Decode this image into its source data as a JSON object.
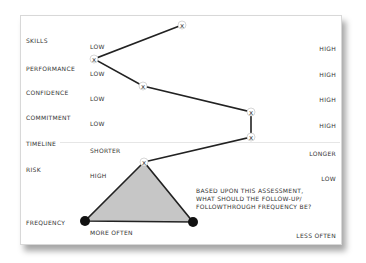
{
  "rows": [
    {
      "label": "SKILLS",
      "low": "LOW",
      "high": "HIGH"
    },
    {
      "label": "PERFORMANCE",
      "low": "LOW",
      "high": "HIGH"
    },
    {
      "label": "CONFIDENCE",
      "low": "LOW",
      "high": "HIGH"
    },
    {
      "label": "COMMITMENT",
      "low": "LOW",
      "high": "HIGH"
    },
    {
      "label": "TIMELINE",
      "low": "SHORTER",
      "high": "LONGER"
    },
    {
      "label": "RISK",
      "low": "HIGH",
      "high": "LOW"
    },
    {
      "label": "FREQUENCY",
      "low": "MORE OFTEN",
      "high": "LESS OFTEN"
    }
  ],
  "question": "BASED UPON THIS ASSESSMENT,\nWHAT SHOULD THE FOLLOW-UP/\nFOLLOWTHROUGH FREQUENCY BE?",
  "markers": [
    {
      "name": "skills",
      "x": 182,
      "y": 25
    },
    {
      "name": "performance",
      "x": 94,
      "y": 59
    },
    {
      "name": "confidence",
      "x": 143,
      "y": 86
    },
    {
      "name": "commitment",
      "x": 251,
      "y": 112
    },
    {
      "name": "timeline",
      "x": 251,
      "y": 137
    },
    {
      "name": "risk",
      "x": 144,
      "y": 162
    }
  ],
  "triangle": {
    "apex": [
      144,
      162
    ],
    "left": [
      85,
      221
    ],
    "right": [
      193,
      222
    ],
    "fill": "#c8c8c8"
  },
  "colors": {
    "line": "#222222",
    "text": "#333333"
  }
}
